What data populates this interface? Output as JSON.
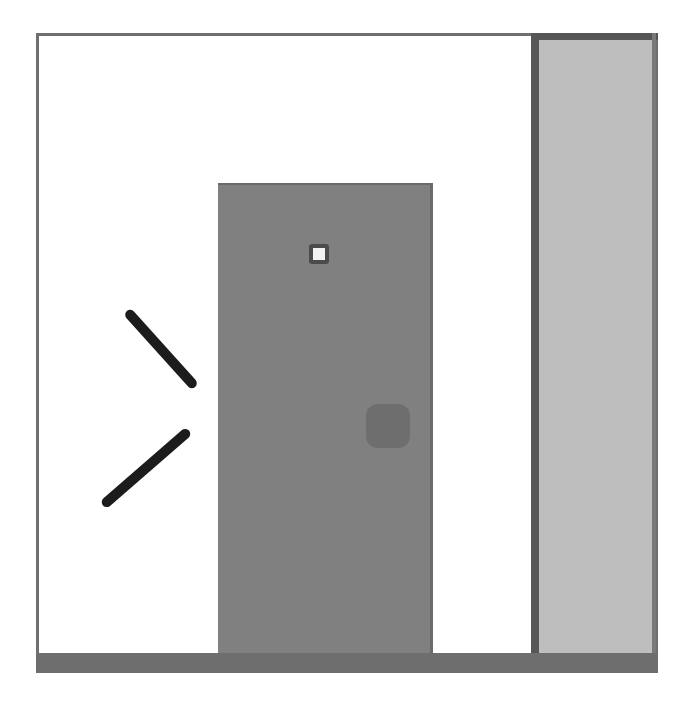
{
  "scene": {
    "title": "Door scene illustration",
    "width": 693,
    "height": 705,
    "background_color": "#ffffff"
  },
  "room": {
    "frame_label": "room-outline",
    "frame_color": "#6f6f6f",
    "interior_color": "#ffffff",
    "floor_label": "floor-threshold",
    "floor_color": "#6e6e6e"
  },
  "door": {
    "label": "door-slab",
    "color": "#808080",
    "edge_color": "#6a6a6a",
    "peephole": {
      "label": "peephole",
      "surround_color": "#4b4b4b",
      "lens_color": "#f2f2f2"
    },
    "knob": {
      "label": "door-knob",
      "color": "#6e6e6e"
    }
  },
  "wall_panel": {
    "label": "right-wall-panel",
    "color": "#bebebe",
    "jamb_color": "#565656",
    "edge_color": "#7a7a7a"
  },
  "strokes": [
    {
      "label": "motion-stroke-upper",
      "color": "#1c1c1c",
      "angle": "48deg"
    },
    {
      "label": "motion-stroke-lower",
      "color": "#1c1c1c",
      "angle": "-41deg"
    }
  ]
}
